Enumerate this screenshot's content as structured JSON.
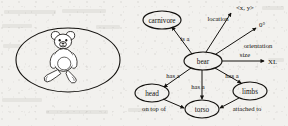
{
  "figure": {
    "left_panel": {
      "name": "teddy-bear-photo",
      "caption": ""
    },
    "graph": {
      "type": "semantic-network",
      "nodes": [
        {
          "id": "carnivore",
          "label": "carnivore",
          "shape": "ellipse",
          "cx": 162,
          "cy": 20,
          "rx": 19,
          "ry": 9
        },
        {
          "id": "bear",
          "label": "bear",
          "shape": "ellipse",
          "cx": 203,
          "cy": 61,
          "rx": 19,
          "ry": 9
        },
        {
          "id": "head",
          "label": "head",
          "shape": "ellipse",
          "cx": 152,
          "cy": 93,
          "rx": 17,
          "ry": 9
        },
        {
          "id": "torso",
          "label": "torso",
          "shape": "ellipse",
          "cx": 202,
          "cy": 109,
          "rx": 17,
          "ry": 9
        },
        {
          "id": "limbs",
          "label": "limbs",
          "shape": "ellipse",
          "cx": 250,
          "cy": 91,
          "rx": 17,
          "ry": 9
        }
      ],
      "value_nodes": [
        {
          "id": "xy",
          "label": "<x, y>"
        },
        {
          "id": "zero",
          "label": "0°"
        },
        {
          "id": "xl",
          "label": "XL"
        }
      ],
      "edges": [
        {
          "from": "bear",
          "to": "carnivore",
          "label": "is a"
        },
        {
          "from": "bear",
          "to": "xy",
          "label": "location"
        },
        {
          "from": "bear",
          "to": "zero",
          "label": "orientation"
        },
        {
          "from": "bear",
          "to": "xl",
          "label": "size"
        },
        {
          "from": "bear",
          "to": "head",
          "label": "has a"
        },
        {
          "from": "bear",
          "to": "torso",
          "label": "has a"
        },
        {
          "from": "bear",
          "to": "limbs",
          "label": "has a"
        },
        {
          "from": "head",
          "to": "torso",
          "label": "on top of"
        },
        {
          "from": "limbs",
          "to": "torso",
          "label": "attached to"
        }
      ]
    },
    "colors": {
      "ink": "#14120f",
      "paper": "#f2f1ee"
    }
  }
}
